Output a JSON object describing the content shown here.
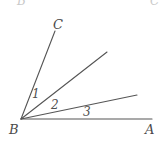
{
  "figure": {
    "type": "angle-diagram",
    "background_color": "#ffffff",
    "stroke_color": "#555555",
    "label_color": "#4a4a4a",
    "width": 162,
    "height": 147
  },
  "vertex": {
    "name": "B",
    "label": "B",
    "x": 21,
    "y": 119
  },
  "rays": [
    {
      "name": "ray-BA",
      "label_at_end": "A",
      "end_x": 152,
      "end_y": 119
    },
    {
      "name": "ray-B-third",
      "label_at_end": "",
      "end_x": 137,
      "end_y": 95
    },
    {
      "name": "ray-B-middle",
      "label_at_end": "",
      "end_x": 107,
      "end_y": 52
    },
    {
      "name": "ray-BC",
      "label_at_end": "C",
      "end_x": 55,
      "end_y": 30
    }
  ],
  "point_labels": {
    "A": "A",
    "B": "B",
    "C": "C"
  },
  "angle_labels": [
    {
      "id": "1",
      "text": "1",
      "x": 32,
      "y": 88
    },
    {
      "id": "2",
      "text": "2",
      "x": 51,
      "y": 99
    },
    {
      "id": "3",
      "text": "3",
      "x": 83,
      "y": 106
    }
  ],
  "cropped_labels": [
    {
      "id": "top-left",
      "text": "B",
      "x": 17,
      "y": -5
    },
    {
      "id": "top-right",
      "text": "C",
      "x": 150,
      "y": -5
    }
  ]
}
